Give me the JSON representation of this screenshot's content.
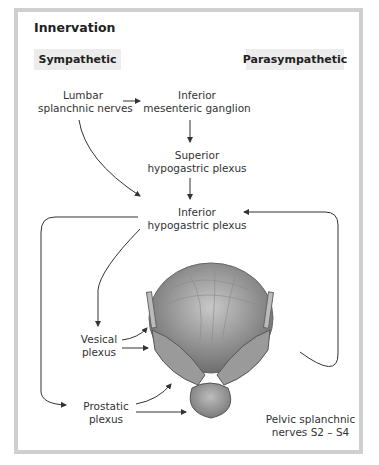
{
  "title": "Innervation",
  "tags": {
    "sympathetic": "Sympathetic",
    "parasympathetic": "Parasympathetic"
  },
  "nodes": {
    "lumbar": [
      "Lumbar",
      "splanchnic nerves"
    ],
    "inf_mes": [
      "Inferior",
      "mesenteric ganglion"
    ],
    "sup_hypo": [
      "Superior",
      "hypogastric plexus"
    ],
    "inf_hypo": [
      "Inferior",
      "hypogastric plexus"
    ],
    "vesical": [
      "Vesical",
      "plexus"
    ],
    "prostatic": [
      "Prostatic",
      "plexus"
    ],
    "pelvic": [
      "Pelvic splanchnic",
      "nerves S2 – S4"
    ]
  },
  "illustration": "bladder-prostate-posterior-view",
  "colors": {
    "border": "#cfcfcf",
    "tag_bg": "#ececec",
    "arrow": "#333333"
  }
}
